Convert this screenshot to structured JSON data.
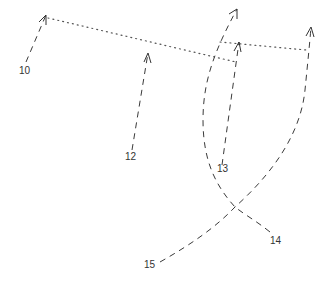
{
  "diagram": {
    "type": "trajectory-sketch",
    "background": "#ffffff",
    "stroke_color": "#3a3a3a",
    "labels": [
      {
        "id": "10",
        "text": "10",
        "x": 19,
        "y": 74
      },
      {
        "id": "12",
        "text": "12",
        "x": 125,
        "y": 160
      },
      {
        "id": "13",
        "text": "13",
        "x": 217,
        "y": 172
      },
      {
        "id": "14",
        "text": "14",
        "x": 270,
        "y": 244
      },
      {
        "id": "15",
        "text": "15",
        "x": 144,
        "y": 268
      }
    ],
    "paths": [
      {
        "id": "path-10",
        "style": "dashed",
        "arrow": true,
        "from": [
          26,
          62
        ],
        "to": [
          46,
          15
        ]
      },
      {
        "id": "path-12",
        "style": "dashed",
        "arrow": true,
        "from": [
          132,
          150
        ],
        "to": [
          148,
          53
        ]
      },
      {
        "id": "path-13",
        "style": "dashed",
        "arrow": true,
        "from": [
          222,
          165
        ],
        "to": [
          239,
          42
        ]
      },
      {
        "id": "path-14",
        "style": "dashed-curve",
        "arrow": true,
        "from": [
          270,
          232
        ],
        "via": [
          [
            235,
            207
          ],
          [
            203,
            120
          ]
        ],
        "to": [
          237,
          9
        ]
      },
      {
        "id": "path-15",
        "style": "dashed-curve",
        "arrow": true,
        "from": [
          160,
          262
        ],
        "via": [
          [
            235,
            207
          ],
          [
            305,
            90
          ]
        ],
        "to": [
          311,
          27
        ]
      }
    ],
    "connectors": [
      {
        "id": "dotted-a",
        "style": "dotted",
        "from": [
          48,
          18
        ],
        "to": [
          236,
          62
        ]
      },
      {
        "id": "dotted-b",
        "style": "dotted",
        "from": [
          220,
          42
        ],
        "to": [
          306,
          50
        ]
      }
    ],
    "crossing_point": [
      235,
      207
    ]
  }
}
